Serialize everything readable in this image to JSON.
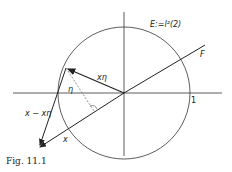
{
  "figure": {
    "caption": "Fig. 11.1",
    "space_label": "E:=l²(2)",
    "subspace_label": "F",
    "unit_label": "1",
    "vector_x_label": "x",
    "vector_xeta_label": "xη",
    "eta_label": "η",
    "difference_label": "x − xη"
  },
  "colors": {
    "ink": "#222222",
    "background": "#ffffff"
  }
}
